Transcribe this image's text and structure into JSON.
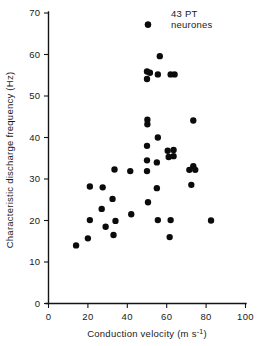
{
  "chart_data": {
    "type": "scatter",
    "title": "",
    "subtitle": "",
    "xlabel": "Conduction velocity (m s⁻¹)",
    "ylabel": "Characteristic discharge frequency (Hz)",
    "xlim": [
      0,
      100
    ],
    "ylim": [
      0,
      70
    ],
    "xticks": [
      0,
      20,
      40,
      60,
      80,
      100
    ],
    "yticks": [
      0,
      10,
      20,
      30,
      40,
      50,
      60,
      70
    ],
    "xtick_labels": [
      "0",
      "20",
      "40",
      "60",
      "80",
      "100"
    ],
    "ytick_labels": [
      "0",
      "10",
      "20",
      "30",
      "40",
      "50",
      "60",
      "70"
    ],
    "grid": false,
    "legend": "none",
    "marker": "filled-circle",
    "marker_color": "#0b0b0b",
    "marker_size": 4.6,
    "n_points": 43,
    "annotations": [
      {
        "text_line1": "43 PT",
        "text_line2": "neurones",
        "x": 62,
        "y": 67.5,
        "marker": true,
        "marker_x": 50.5,
        "marker_y": 67.2
      }
    ],
    "series": [
      {
        "name": "PT neurones",
        "points": [
          {
            "x": 50.5,
            "y": 67.2
          },
          {
            "x": 56.5,
            "y": 59.6
          },
          {
            "x": 50.0,
            "y": 55.9
          },
          {
            "x": 51.5,
            "y": 55.6
          },
          {
            "x": 50.0,
            "y": 54.1
          },
          {
            "x": 55.5,
            "y": 55.2
          },
          {
            "x": 62.0,
            "y": 55.2
          },
          {
            "x": 64.0,
            "y": 55.2
          },
          {
            "x": 50.2,
            "y": 44.3
          },
          {
            "x": 50.2,
            "y": 43.2
          },
          {
            "x": 73.5,
            "y": 44.1
          },
          {
            "x": 55.5,
            "y": 40.0
          },
          {
            "x": 50.0,
            "y": 38.0
          },
          {
            "x": 60.5,
            "y": 36.8
          },
          {
            "x": 63.5,
            "y": 37.0
          },
          {
            "x": 61.0,
            "y": 35.3
          },
          {
            "x": 63.5,
            "y": 35.5
          },
          {
            "x": 50.0,
            "y": 34.5
          },
          {
            "x": 55.0,
            "y": 34.0
          },
          {
            "x": 33.5,
            "y": 32.3
          },
          {
            "x": 41.5,
            "y": 31.9
          },
          {
            "x": 50.0,
            "y": 31.9
          },
          {
            "x": 71.5,
            "y": 32.2
          },
          {
            "x": 73.5,
            "y": 33.1
          },
          {
            "x": 74.5,
            "y": 32.2
          },
          {
            "x": 21.0,
            "y": 28.2
          },
          {
            "x": 27.5,
            "y": 28.0
          },
          {
            "x": 55.0,
            "y": 27.8
          },
          {
            "x": 72.5,
            "y": 28.6
          },
          {
            "x": 32.5,
            "y": 25.2
          },
          {
            "x": 50.5,
            "y": 24.4
          },
          {
            "x": 27.0,
            "y": 22.8
          },
          {
            "x": 42.0,
            "y": 21.5
          },
          {
            "x": 21.0,
            "y": 20.1
          },
          {
            "x": 34.0,
            "y": 19.9
          },
          {
            "x": 55.5,
            "y": 20.1
          },
          {
            "x": 62.0,
            "y": 20.1
          },
          {
            "x": 82.5,
            "y": 20.0
          },
          {
            "x": 29.0,
            "y": 18.5
          },
          {
            "x": 33.0,
            "y": 16.5
          },
          {
            "x": 61.5,
            "y": 16.0
          },
          {
            "x": 20.0,
            "y": 15.7
          },
          {
            "x": 14.0,
            "y": 14.0
          }
        ]
      }
    ]
  },
  "axes": {
    "x_title": "Conduction velocity (m s⁻¹)",
    "y_title": "Characteristic discharge frequency (Hz)"
  },
  "annotation": {
    "line1": "43 PT",
    "line2": "neurones"
  },
  "xtick_labels": [
    "0",
    "20",
    "40",
    "60",
    "80",
    "100"
  ],
  "ytick_labels": [
    "0",
    "10",
    "20",
    "30",
    "40",
    "50",
    "60",
    "70"
  ],
  "colors": {
    "marker": "#0b0b0b",
    "axis": "#141414",
    "background": "#ffffff"
  }
}
